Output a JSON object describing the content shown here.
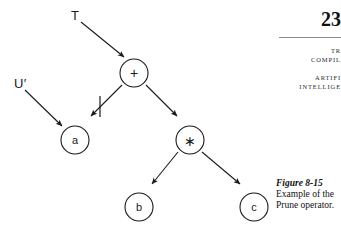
{
  "page": {
    "folio": "23",
    "running_head_lines_1": [
      "TR",
      "COMPIL"
    ],
    "running_head_lines_2": [
      "ARTIFI",
      "INTELLIGE"
    ]
  },
  "caption": {
    "title": "Figure 8-15",
    "body": "Example of the Prune operator."
  },
  "diagram": {
    "type": "expression-tree",
    "set_labels": [
      {
        "name": "T",
        "text": "T",
        "points_to": "plus"
      },
      {
        "name": "U-prime",
        "text": "U′",
        "points_to": "a"
      }
    ],
    "nodes": [
      {
        "id": "plus",
        "label": "+",
        "cx": 134,
        "cy": 73,
        "r": 14
      },
      {
        "id": "a",
        "label": "a",
        "cx": 75,
        "cy": 140,
        "r": 14
      },
      {
        "id": "times",
        "label": "∗",
        "cx": 190,
        "cy": 140,
        "r": 14
      },
      {
        "id": "b",
        "label": "b",
        "cx": 139,
        "cy": 207,
        "r": 14
      },
      {
        "id": "c",
        "label": "c",
        "cx": 254,
        "cy": 207,
        "r": 14
      }
    ],
    "edges": [
      {
        "from": "plus",
        "to": "a",
        "pruned": true
      },
      {
        "from": "plus",
        "to": "times",
        "pruned": false
      },
      {
        "from": "times",
        "to": "b",
        "pruned": false
      },
      {
        "from": "times",
        "to": "c",
        "pruned": false
      }
    ],
    "prune_mark": {
      "name": "prune-tick",
      "x": 100,
      "y": 107
    },
    "colors": {
      "stroke": "#1a1a1a",
      "text": "#1a1a1a",
      "rule": "#8d8d8d"
    }
  }
}
